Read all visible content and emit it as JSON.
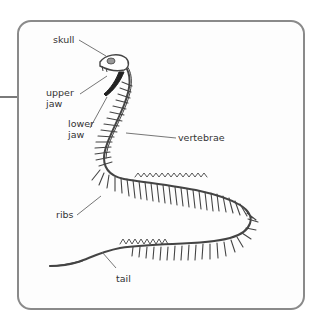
{
  "diagram": {
    "labels": {
      "skull": "skull",
      "upper_jaw_1": "upper",
      "upper_jaw_2": "jaw",
      "lower_jaw_1": "lower",
      "lower_jaw_2": "jaw",
      "vertebrae": "vertebrae",
      "ribs": "ribs",
      "tail": "tail"
    },
    "colors": {
      "border": "#8a8a8a",
      "line": "#555555",
      "bone": "#444444",
      "text": "#333333"
    }
  }
}
